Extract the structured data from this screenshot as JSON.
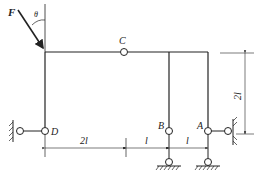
{
  "diagram": {
    "type": "structural-frame",
    "labels": {
      "force": "F",
      "angle": "θ",
      "hinge_c": "C",
      "hinge_d": "D",
      "hinge_b": "B",
      "hinge_a": "A"
    },
    "dimensions": {
      "d_to_b": "2l",
      "b_to_mid": "l",
      "mid_to_a": "l",
      "height": "2l"
    },
    "colors": {
      "line": "#222222",
      "background": "#ffffff"
    }
  }
}
